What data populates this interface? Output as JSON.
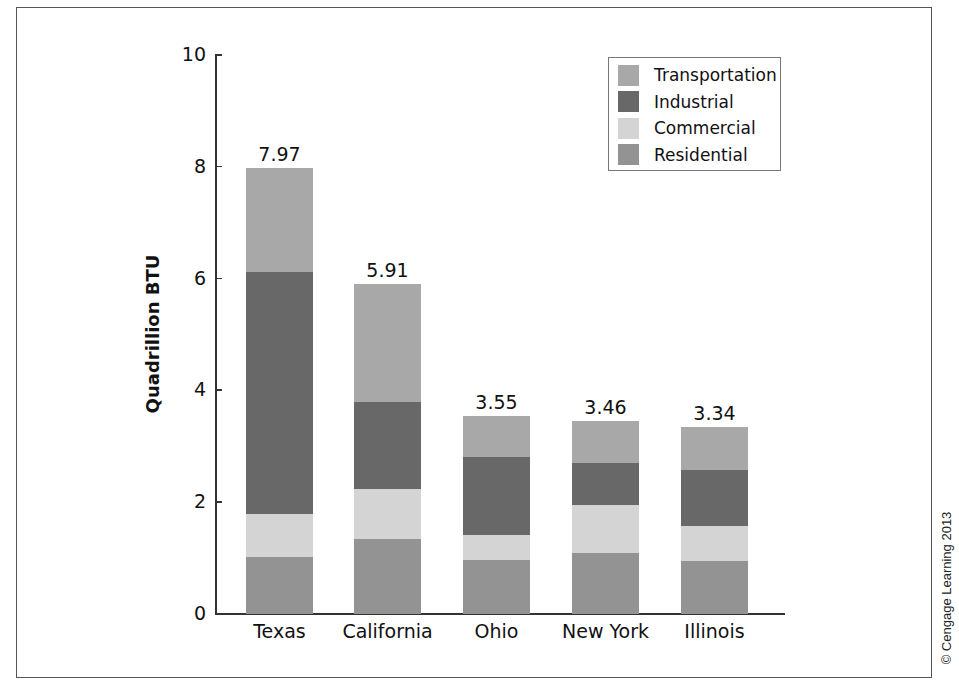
{
  "chart_data": {
    "type": "bar",
    "stacked": true,
    "title": "",
    "xlabel": "",
    "ylabel": "Quadrillion BTU",
    "ylim": [
      0,
      10
    ],
    "yticks": [
      0,
      2,
      4,
      6,
      8,
      10
    ],
    "grid": false,
    "legend_position": "upper right",
    "categories": [
      "Texas",
      "California",
      "Ohio",
      "New York",
      "Illinois"
    ],
    "totals": [
      7.97,
      5.91,
      3.55,
      3.46,
      3.34
    ],
    "total_labels": [
      "7.97",
      "5.91",
      "3.55",
      "3.46",
      "3.34"
    ],
    "series": [
      {
        "name": "Residential",
        "color": "#939393",
        "values": [
          1.02,
          1.35,
          0.96,
          1.09,
          0.94
        ]
      },
      {
        "name": "Commercial",
        "color": "#d4d4d4",
        "values": [
          0.77,
          0.88,
          0.46,
          0.86,
          0.64
        ]
      },
      {
        "name": "Industrial",
        "color": "#686868",
        "values": [
          4.33,
          1.56,
          1.39,
          0.76,
          1.0
        ]
      },
      {
        "name": "Transportation",
        "color": "#a8a8a8",
        "values": [
          1.85,
          2.12,
          0.74,
          0.75,
          0.76
        ]
      }
    ],
    "legend_order": [
      "Transportation",
      "Industrial",
      "Commercial",
      "Residential"
    ]
  },
  "copyright": "© Cengage Learning 2013"
}
